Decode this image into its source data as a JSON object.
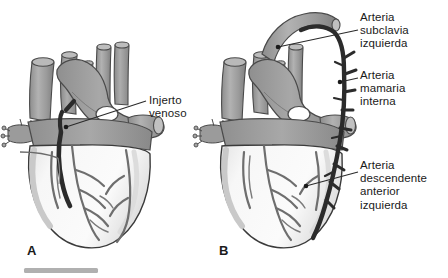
{
  "figure": {
    "background_color": "#ffffff",
    "style": "grayscale medical line illustration"
  },
  "panels": [
    {
      "id": "A",
      "letter": "A",
      "description": "Corazon con injerto de vena safena desde la aorta ascendente hasta la arteria coronaria"
    },
    {
      "id": "B",
      "letter": "B",
      "description": "Corazon con injerto de arteria mamaria interna izquierda a la arteria descendente anterior izquierda"
    }
  ],
  "labels": {
    "injerto_venoso": "Injerto\nvenoso",
    "arteria_subclavia_izquierda": "Arteria\nsubclavia\nizquierda",
    "arteria_mamaria_interna": "Arteria\nmamaria\ninterna",
    "arteria_descendente_anterior_izquierda": "Arteria\ndescendente\nanterior\nizquierda"
  },
  "colors": {
    "background": "#ffffff",
    "great_vessel_gray": "#9a9a9a",
    "great_vessel_shadow": "#848484",
    "great_vessel_highlight": "#b4b4b4",
    "ventricle_white": "#fafafa",
    "ventricle_shade": "#e6e6e6",
    "coronary_gray": "#6e6e6e",
    "graft_dark": "#2b2b2b",
    "outline": "#3a3a3a",
    "label_text": "#1a1a1a",
    "leader_line": "#2b2b2b",
    "bottom_rule": "#b0b0b0"
  },
  "bottom_rule": {
    "present": true,
    "color": "#b0b0b0"
  }
}
